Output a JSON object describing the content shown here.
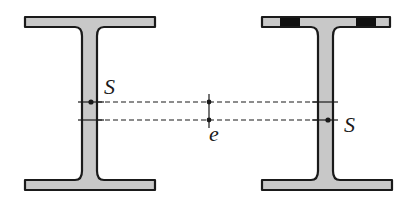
{
  "diagram": {
    "colors": {
      "fill": "#c8c8c8",
      "stroke": "#1a1a1a",
      "hole": "#111111",
      "background": "#ffffff"
    },
    "labels": {
      "left_centroid": "S",
      "right_centroid": "S",
      "eccentricity": "e"
    },
    "left_beam": {
      "name": "full-section",
      "holes": false
    },
    "right_beam": {
      "name": "weakened-section",
      "holes": true,
      "hole_count": 2
    }
  }
}
